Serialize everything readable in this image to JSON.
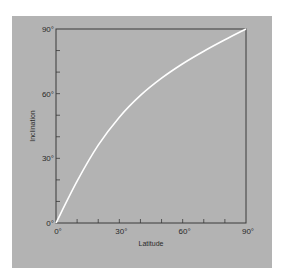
{
  "chart_data": {
    "type": "line",
    "title": "",
    "xlabel": "Latitude",
    "ylabel": "Inclination",
    "xlim": [
      0,
      90
    ],
    "ylim": [
      0,
      90
    ],
    "x_ticks": [
      "0°",
      "30°",
      "60°",
      "90°"
    ],
    "y_ticks": [
      "0°",
      "30°",
      "60°",
      "90°"
    ],
    "minor_ticks_per_major": 3,
    "grid": false,
    "legend": null,
    "series": [
      {
        "name": "Inclination vs Latitude",
        "color": "#ffffff",
        "x": [
          0,
          10,
          20,
          30,
          40,
          50,
          60,
          70,
          80,
          90
        ],
        "y": [
          0,
          19.4,
          36.1,
          49.1,
          59.2,
          67.2,
          73.9,
          79.7,
          85.0,
          90
        ]
      }
    ]
  },
  "colors": {
    "background": "#ffffff",
    "panel": "#b3b3b3",
    "axis": "#3a3a3a",
    "curve": "#ffffff"
  }
}
